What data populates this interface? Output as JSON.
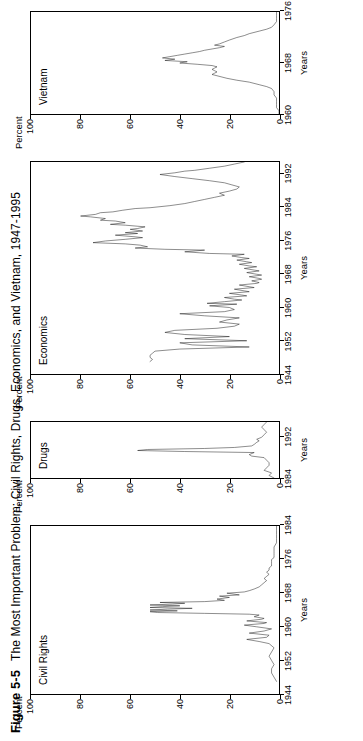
{
  "figure": {
    "number": "Figure 5-5",
    "title": "The Most Important Problem: Civil Rights, Drugs, Economics, and Vietnam, 1947-1995"
  },
  "axes": {
    "ylabel": "Percent",
    "xlabel": "Years",
    "yticks": [
      "100",
      "80",
      "60",
      "40",
      "20",
      "0"
    ],
    "ylim": [
      0,
      100
    ]
  },
  "chart_data": [
    {
      "type": "line",
      "title": "Civil Rights",
      "xlabel": "Years",
      "ylabel": "Percent",
      "xlim": [
        1944,
        1984
      ],
      "ylim": [
        0,
        100
      ],
      "xticks": [
        1944,
        1952,
        1960,
        1968,
        1976,
        1984
      ],
      "grid": false,
      "legend": "none",
      "x": [
        1947,
        1948,
        1949,
        1950,
        1951,
        1952,
        1953,
        1954,
        1955,
        1956,
        1956.5,
        1957,
        1957.5,
        1958,
        1958.5,
        1959,
        1959.5,
        1960,
        1960.4,
        1960.8,
        1961,
        1961.4,
        1961.8,
        1962,
        1962.4,
        1962.8,
        1963,
        1963.2,
        1963.4,
        1963.6,
        1963.8,
        1964,
        1964.2,
        1964.4,
        1964.6,
        1964.8,
        1965,
        1965.2,
        1965.4,
        1965.6,
        1965.8,
        1966,
        1966.3,
        1966.6,
        1967,
        1967.3,
        1967.6,
        1968,
        1968.3,
        1968.6,
        1969,
        1969.5,
        1970,
        1970.5,
        1971,
        1971.5,
        1972,
        1972.5,
        1973,
        1973.5,
        1974,
        1974.5,
        1975,
        1975.5,
        1976,
        1976.5,
        1977,
        1977.5,
        1978,
        1979,
        1980,
        1981,
        1982,
        1983,
        1984
      ],
      "values": [
        1,
        2,
        3,
        3,
        2,
        3,
        4,
        3,
        2,
        4,
        8,
        13,
        5,
        4,
        12,
        6,
        3,
        9,
        14,
        6,
        5,
        13,
        7,
        6,
        10,
        8,
        12,
        30,
        49,
        52,
        41,
        52,
        45,
        35,
        52,
        47,
        40,
        52,
        43,
        38,
        48,
        30,
        22,
        25,
        20,
        24,
        16,
        21,
        14,
        12,
        10,
        8,
        7,
        6,
        5,
        6,
        5,
        4,
        5,
        4,
        4,
        3,
        3,
        3,
        3,
        2,
        2,
        2,
        2,
        2,
        1,
        1,
        1,
        1,
        1
      ]
    },
    {
      "type": "line",
      "title": "Drugs",
      "xlabel": "Years",
      "ylabel": "Percent",
      "xlim": [
        1984,
        1995
      ],
      "ylim": [
        0,
        100
      ],
      "xticks": [
        1984,
        1992
      ],
      "grid": false,
      "legend": "none",
      "x": [
        1984,
        1984.5,
        1985,
        1985.5,
        1986,
        1986.5,
        1987,
        1987.5,
        1988,
        1988.3,
        1988.6,
        1989,
        1989.2,
        1989.4,
        1989.6,
        1989.8,
        1990,
        1990.3,
        1990.6,
        1991,
        1991.3,
        1991.6,
        1992,
        1992.5,
        1993,
        1993.5,
        1994,
        1994.5,
        1995
      ],
      "values": [
        2,
        4,
        3,
        6,
        5,
        4,
        4,
        5,
        6,
        11,
        12,
        10,
        38,
        57,
        53,
        30,
        18,
        11,
        10,
        9,
        8,
        9,
        7,
        6,
        5,
        6,
        7,
        6,
        5
      ]
    },
    {
      "type": "line",
      "title": "Economics",
      "xlabel": "Years",
      "ylabel": "Percent",
      "xlim": [
        1944,
        1995
      ],
      "ylim": [
        0,
        100
      ],
      "xticks": [
        1944,
        1952,
        1960,
        1968,
        1976,
        1984,
        1992
      ],
      "grid": false,
      "legend": "none",
      "x": [
        1947,
        1947.5,
        1948,
        1948.5,
        1949,
        1949.5,
        1950,
        1950.5,
        1951,
        1951.5,
        1952,
        1952.5,
        1953,
        1953.5,
        1954,
        1954.5,
        1955,
        1955.5,
        1956,
        1956.5,
        1957,
        1957.5,
        1958,
        1958.5,
        1959,
        1959.5,
        1960,
        1960.4,
        1960.8,
        1961,
        1961.4,
        1961.8,
        1962,
        1962.4,
        1962.8,
        1963,
        1963.4,
        1963.8,
        1964,
        1964.4,
        1964.8,
        1965,
        1965.4,
        1965.8,
        1966,
        1966.4,
        1966.8,
        1967,
        1967.4,
        1967.8,
        1968,
        1968.4,
        1968.8,
        1969,
        1969.4,
        1969.8,
        1970,
        1970.4,
        1970.8,
        1971,
        1971.4,
        1971.8,
        1972,
        1972.4,
        1972.8,
        1973,
        1973.4,
        1973.8,
        1974,
        1974.3,
        1974.6,
        1975,
        1975.3,
        1975.6,
        1976,
        1976.4,
        1976.8,
        1977,
        1977.4,
        1977.8,
        1978,
        1978.4,
        1978.8,
        1979,
        1979.4,
        1979.8,
        1980,
        1980.4,
        1980.8,
        1981,
        1981.4,
        1981.8,
        1982,
        1982.4,
        1982.8,
        1983,
        1983.4,
        1983.8,
        1984,
        1984.5,
        1985,
        1985.5,
        1986,
        1986.5,
        1987,
        1987.5,
        1988,
        1988.5,
        1989,
        1989.5,
        1990,
        1990.5,
        1991,
        1991.5,
        1992,
        1992.4,
        1992.8,
        1993,
        1993.5,
        1994,
        1994.5,
        1995
      ],
      "values": [
        52,
        51,
        52,
        52,
        51,
        50,
        40,
        12,
        35,
        40,
        13,
        38,
        20,
        38,
        46,
        42,
        25,
        18,
        16,
        24,
        21,
        16,
        30,
        40,
        22,
        18,
        20,
        28,
        17,
        29,
        22,
        15,
        18,
        22,
        13,
        15,
        20,
        12,
        14,
        18,
        10,
        12,
        16,
        9,
        8,
        11,
        7,
        8,
        12,
        7,
        9,
        13,
        8,
        10,
        14,
        9,
        12,
        16,
        11,
        13,
        17,
        12,
        15,
        19,
        14,
        28,
        38,
        30,
        46,
        58,
        53,
        56,
        62,
        75,
        70,
        62,
        55,
        58,
        66,
        57,
        62,
        55,
        60,
        57,
        54,
        62,
        68,
        62,
        66,
        72,
        70,
        76,
        80,
        74,
        72,
        67,
        63,
        58,
        52,
        44,
        38,
        34,
        30,
        26,
        22,
        24,
        20,
        17,
        16,
        19,
        22,
        28,
        35,
        42,
        48,
        42,
        38,
        34,
        28,
        22,
        18,
        14
      ]
    },
    {
      "type": "line",
      "title": "Vietnam",
      "xlabel": "Years",
      "ylabel": "Percent",
      "xlim": [
        1960,
        1976
      ],
      "ylim": [
        0,
        100
      ],
      "xticks": [
        1960,
        1968,
        1976
      ],
      "grid": false,
      "legend": "none",
      "x": [
        1960,
        1960.5,
        1961,
        1961.5,
        1962,
        1962.5,
        1963,
        1963.5,
        1964,
        1964.3,
        1964.6,
        1965,
        1965.3,
        1965.6,
        1966,
        1966.2,
        1966.4,
        1966.6,
        1966.8,
        1967,
        1967.2,
        1967.4,
        1967.6,
        1967.8,
        1968,
        1968.2,
        1968.4,
        1968.6,
        1968.8,
        1969,
        1969.2,
        1969.4,
        1969.6,
        1969.8,
        1970,
        1970.2,
        1970.4,
        1970.6,
        1970.8,
        1971,
        1971.3,
        1971.6,
        1972,
        1972.3,
        1972.6,
        1973,
        1973.3,
        1973.6,
        1974,
        1974.5,
        1975,
        1975.5,
        1976
      ],
      "values": [
        0,
        0,
        1,
        1,
        1,
        1,
        2,
        2,
        3,
        5,
        8,
        12,
        17,
        21,
        25,
        27,
        26,
        25,
        26,
        27,
        26,
        25,
        27,
        33,
        40,
        37,
        46,
        42,
        47,
        44,
        41,
        38,
        35,
        32,
        30,
        27,
        24,
        22,
        26,
        24,
        22,
        20,
        17,
        14,
        12,
        8,
        5,
        3,
        2,
        1,
        1,
        1,
        1
      ]
    }
  ]
}
